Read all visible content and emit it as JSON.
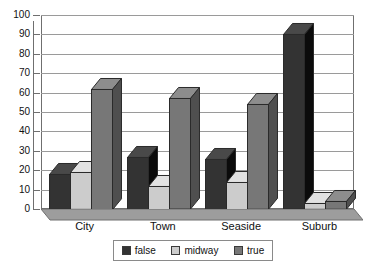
{
  "chart_data": {
    "type": "bar",
    "title": "",
    "subtitle": "",
    "xlabel": "",
    "ylabel": "",
    "categories": [
      "City",
      "Town",
      "Seaside",
      "Suburb"
    ],
    "series": [
      {
        "name": "false",
        "color": "#333333",
        "values": [
          18,
          27,
          26,
          90
        ]
      },
      {
        "name": "midway",
        "color": "#cccccc",
        "values": [
          19,
          12,
          14,
          3
        ]
      },
      {
        "name": "true",
        "color": "#777777",
        "values": [
          62,
          57,
          54,
          4
        ]
      }
    ],
    "ylim": [
      0,
      100
    ],
    "ytick_step": 10,
    "yticks": [
      0,
      10,
      20,
      30,
      40,
      50,
      60,
      70,
      80,
      90,
      100
    ],
    "ytick_labels": [
      "0",
      "10",
      "20",
      "30",
      "40",
      "50",
      "60",
      "70",
      "80",
      "90",
      "100"
    ],
    "grid": true,
    "grid_axis": "y",
    "legend_position": "bottom",
    "style": "3d-column",
    "background": "#ffffff",
    "axis_color": "#6f6f6f",
    "grid_color": "#9a9a9a",
    "text_color": "#111111"
  }
}
